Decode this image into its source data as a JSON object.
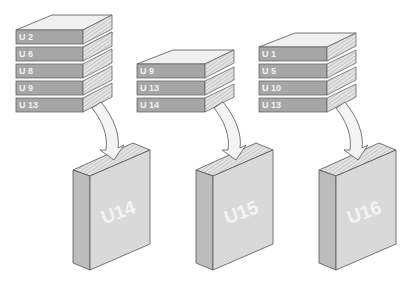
{
  "diagram": {
    "colors": {
      "spine": "#a6a6a6",
      "spine_text": "#f2f2f2",
      "top_cover": "#f0f0f0",
      "pages": "#d0d0d0",
      "outline": "#555555",
      "arrow_fill": "#f4f4f4",
      "big_front": "#d9d9d9",
      "big_side": "#bcbcbc"
    },
    "stacks": [
      {
        "books": [
          "U 2",
          "U 6",
          "U 8",
          "U 9",
          "U 13"
        ],
        "target": "U14"
      },
      {
        "books": [
          "U 9",
          "U 13",
          "U 14"
        ],
        "target": "U15"
      },
      {
        "books": [
          "U 1",
          "U 5",
          "U 10",
          "U 13"
        ],
        "target": "U16"
      }
    ]
  }
}
